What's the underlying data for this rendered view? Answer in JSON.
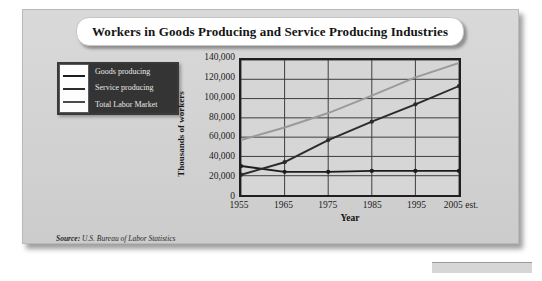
{
  "figure": {
    "title": "Workers in Goods Producing and Service Producing Industries",
    "source_prefix": "Source:",
    "source_text": " U.S. Bureau of Labor Statistics"
  },
  "legend": {
    "items": [
      {
        "label": "Goods producing",
        "color": "#1c1c1c"
      },
      {
        "label": "Service producing",
        "color": "#2b2b2b"
      },
      {
        "label": "Total Labor Market",
        "color": "#9a9a9a"
      }
    ]
  },
  "chart_data": {
    "type": "line",
    "title": "Workers in Goods Producing and Service Producing Industries",
    "xlabel": "Year",
    "ylabel": "Thousands of workers",
    "categories": [
      "1955",
      "1965",
      "1975",
      "1985",
      "1995",
      "2005 est."
    ],
    "ytick_labels": [
      "0",
      "20,000",
      "40,000",
      "60,000",
      "80,000",
      "100,000",
      "120,000",
      "140,000"
    ],
    "ytick_values": [
      0,
      20000,
      40000,
      60000,
      80000,
      100000,
      120000,
      140000
    ],
    "ylim": [
      0,
      140000
    ],
    "grid": true,
    "legend_position": "upper-left-outside",
    "series": [
      {
        "name": "Goods producing",
        "color": "#1c1c1c",
        "values": [
          30000,
          24000,
          24000,
          25000,
          25000,
          25000
        ]
      },
      {
        "name": "Service producing",
        "color": "#2b2b2b",
        "values": [
          21000,
          34000,
          57000,
          76000,
          94000,
          113000
        ]
      },
      {
        "name": "Total Labor Market",
        "color": "#9a9a9a",
        "values": [
          57000,
          70000,
          85000,
          103000,
          122000,
          137000
        ]
      }
    ]
  }
}
